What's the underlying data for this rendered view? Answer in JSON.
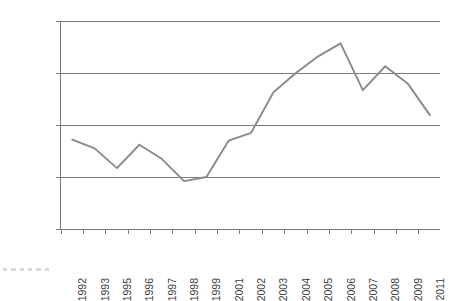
{
  "chart_data": {
    "type": "line",
    "title": "",
    "subtitle": "",
    "xlabel": "",
    "ylabel": "",
    "categories": [
      "1992",
      "1993",
      "1995",
      "1996",
      "1997",
      "1998",
      "1999",
      "2001",
      "2002",
      "2003",
      "2004",
      "2005",
      "2006",
      "2007",
      "2008",
      "2009",
      "2011"
    ],
    "values": [
      16.72,
      16.55,
      16.17,
      16.62,
      16.35,
      15.92,
      16.0,
      16.7,
      16.85,
      17.63,
      18.0,
      18.32,
      18.57,
      17.67,
      18.13,
      17.8,
      17.19
    ],
    "series": [
      {
        "name": "",
        "values": [
          16.72,
          16.55,
          16.17,
          16.62,
          16.35,
          15.92,
          16.0,
          16.7,
          16.85,
          17.63,
          18.0,
          18.32,
          18.57,
          17.67,
          18.13,
          17.8,
          17.19
        ]
      }
    ],
    "ylim": [
      15.0,
      19.0
    ],
    "ytick_values": [
      19.0,
      18.0,
      17.0,
      16.0,
      15.0
    ],
    "ytick_labels": [
      "19,0%",
      "18,0%",
      "17,0%",
      "16,0%",
      "15,0%"
    ],
    "xtick_labels": [
      "1992",
      "1993",
      "1995",
      "1996",
      "1997",
      "1998",
      "1999",
      "2001",
      "2002",
      "2003",
      "2004",
      "2005",
      "2006",
      "2007",
      "2008",
      "2009",
      "2011"
    ],
    "grid": true,
    "grid_axis": "y",
    "legend": false,
    "legend_position": "none",
    "annotations": [],
    "colors": {
      "line": "#8a8a8a",
      "grid": "#7a7a7a",
      "axis": "#7a7a7a",
      "text": "#3d3d3d",
      "background": "#ffffff"
    }
  },
  "decorations": {
    "corner_dots_count": 6
  }
}
